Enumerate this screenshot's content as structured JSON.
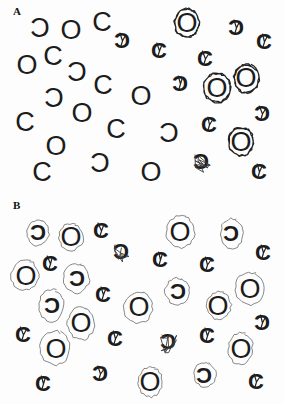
{
  "figure": {
    "ink_color": "#1c1c1c",
    "mark_color": "#3a3a3a"
  },
  "panels": [
    {
      "label": "A",
      "items": [
        {
          "glyph": "rc",
          "x": 40,
          "y": 28,
          "mark": "none"
        },
        {
          "glyph": "O",
          "x": 71,
          "y": 30,
          "mark": "none"
        },
        {
          "glyph": "C",
          "x": 102,
          "y": 22,
          "mark": "none"
        },
        {
          "glyph": "rc",
          "x": 122,
          "y": 40,
          "mark": "slash"
        },
        {
          "glyph": "O",
          "x": 187,
          "y": 23,
          "mark": "circle"
        },
        {
          "glyph": "rc",
          "x": 236,
          "y": 27,
          "mark": "slash"
        },
        {
          "glyph": "C",
          "x": 264,
          "y": 41,
          "mark": "slash"
        },
        {
          "glyph": "O",
          "x": 27,
          "y": 65,
          "mark": "none"
        },
        {
          "glyph": "C",
          "x": 53,
          "y": 56,
          "mark": "none"
        },
        {
          "glyph": "C",
          "x": 159,
          "y": 50,
          "mark": "slash"
        },
        {
          "glyph": "C",
          "x": 205,
          "y": 58,
          "mark": "slash"
        },
        {
          "glyph": "rc",
          "x": 77,
          "y": 72,
          "mark": "none"
        },
        {
          "glyph": "O",
          "x": 246,
          "y": 78,
          "mark": "circle"
        },
        {
          "glyph": "rc",
          "x": 180,
          "y": 83,
          "mark": "slash"
        },
        {
          "glyph": "C",
          "x": 103,
          "y": 85,
          "mark": "none"
        },
        {
          "glyph": "O",
          "x": 217,
          "y": 88,
          "mark": "circle"
        },
        {
          "glyph": "rc",
          "x": 54,
          "y": 98,
          "mark": "none"
        },
        {
          "glyph": "O",
          "x": 141,
          "y": 96,
          "mark": "none"
        },
        {
          "glyph": "O",
          "x": 82,
          "y": 113,
          "mark": "none"
        },
        {
          "glyph": "C",
          "x": 25,
          "y": 122,
          "mark": "none"
        },
        {
          "glyph": "C",
          "x": 116,
          "y": 129,
          "mark": "none"
        },
        {
          "glyph": "rc",
          "x": 169,
          "y": 133,
          "mark": "none"
        },
        {
          "glyph": "C",
          "x": 209,
          "y": 124,
          "mark": "slash"
        },
        {
          "glyph": "rc",
          "x": 262,
          "y": 113,
          "mark": "slash"
        },
        {
          "glyph": "O",
          "x": 241,
          "y": 142,
          "mark": "circle"
        },
        {
          "glyph": "O",
          "x": 56,
          "y": 146,
          "mark": "none"
        },
        {
          "glyph": "rc",
          "x": 201,
          "y": 161,
          "mark": "scribble"
        },
        {
          "glyph": "rc",
          "x": 100,
          "y": 163,
          "mark": "none"
        },
        {
          "glyph": "C",
          "x": 42,
          "y": 172,
          "mark": "none"
        },
        {
          "glyph": "O",
          "x": 151,
          "y": 172,
          "mark": "none"
        },
        {
          "glyph": "C",
          "x": 259,
          "y": 171,
          "mark": "slash"
        }
      ]
    },
    {
      "label": "B",
      "items": [
        {
          "glyph": "rc",
          "x": 38,
          "y": 36,
          "mark": "circle"
        },
        {
          "glyph": "O",
          "x": 71,
          "y": 41,
          "mark": "circle"
        },
        {
          "glyph": "C",
          "x": 101,
          "y": 34,
          "mark": "slash"
        },
        {
          "glyph": "rc",
          "x": 121,
          "y": 55,
          "mark": "scribble"
        },
        {
          "glyph": "O",
          "x": 180,
          "y": 36,
          "mark": "circle"
        },
        {
          "glyph": "rc",
          "x": 231,
          "y": 37,
          "mark": "circle"
        },
        {
          "glyph": "C",
          "x": 263,
          "y": 56,
          "mark": "slash"
        },
        {
          "glyph": "C",
          "x": 160,
          "y": 63,
          "mark": "slash"
        },
        {
          "glyph": "C",
          "x": 50,
          "y": 67,
          "mark": "slash"
        },
        {
          "glyph": "C",
          "x": 207,
          "y": 68,
          "mark": "slash"
        },
        {
          "glyph": "O",
          "x": 26,
          "y": 80,
          "mark": "circle"
        },
        {
          "glyph": "rc",
          "x": 77,
          "y": 82,
          "mark": "circle"
        },
        {
          "glyph": "O",
          "x": 250,
          "y": 93,
          "mark": "circle"
        },
        {
          "glyph": "C",
          "x": 103,
          "y": 98,
          "mark": "slash"
        },
        {
          "glyph": "rc",
          "x": 178,
          "y": 95,
          "mark": "circle"
        },
        {
          "glyph": "O",
          "x": 139,
          "y": 111,
          "mark": "circle"
        },
        {
          "glyph": "O",
          "x": 218,
          "y": 110,
          "mark": "circle"
        },
        {
          "glyph": "rc",
          "x": 52,
          "y": 109,
          "mark": "circle"
        },
        {
          "glyph": "O",
          "x": 81,
          "y": 127,
          "mark": "circle"
        },
        {
          "glyph": "rc",
          "x": 262,
          "y": 126,
          "mark": "slash"
        },
        {
          "glyph": "C",
          "x": 23,
          "y": 138,
          "mark": "slash"
        },
        {
          "glyph": "C",
          "x": 115,
          "y": 142,
          "mark": "slash"
        },
        {
          "glyph": "rc",
          "x": 168,
          "y": 145,
          "mark": "scribble"
        },
        {
          "glyph": "C",
          "x": 207,
          "y": 139,
          "mark": "slash"
        },
        {
          "glyph": "O",
          "x": 241,
          "y": 153,
          "mark": "circle"
        },
        {
          "glyph": "O",
          "x": 56,
          "y": 153,
          "mark": "circle"
        },
        {
          "glyph": "rc",
          "x": 100,
          "y": 177,
          "mark": "slash"
        },
        {
          "glyph": "C",
          "x": 43,
          "y": 187,
          "mark": "slash"
        },
        {
          "glyph": "O",
          "x": 150,
          "y": 186,
          "mark": "circle"
        },
        {
          "glyph": "rc",
          "x": 204,
          "y": 179,
          "mark": "circle"
        },
        {
          "glyph": "C",
          "x": 256,
          "y": 185,
          "mark": "slash"
        }
      ]
    }
  ]
}
